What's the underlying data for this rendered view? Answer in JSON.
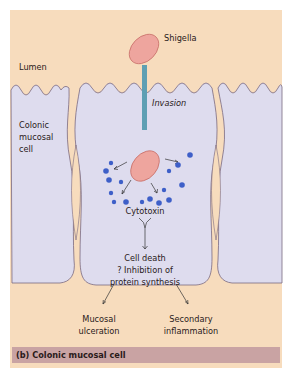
{
  "figure": {
    "caption": "(b) Colonic mucosal cell",
    "labels": {
      "lumen": "Lumen",
      "shigella": "Shigella",
      "invasion": "Invasion",
      "cell_line1": "Colonic",
      "cell_line2": "mucosal",
      "cell_line3": "cell",
      "cytotoxin": "Cytotoxin",
      "effect_line1": "Cell death",
      "effect_line2": "? Inhibition of",
      "effect_line3": "protein synthesis",
      "outcome_left_line1": "Mucosal",
      "outcome_left_line2": "ulceration",
      "outcome_right_line1": "Secondary",
      "outcome_right_line2": "inflammation"
    },
    "colors": {
      "background": "#f7dcbd",
      "cell_fill": "#dedcee",
      "cell_outline": "#7a6a82",
      "bacterium_fill": "#eea59e",
      "bacterium_stroke": "#c9706a",
      "invasion_bar": "#5e9fb3",
      "toxin_dots": "#3e5fc8",
      "caption_bar": "#c9a3a3"
    }
  }
}
